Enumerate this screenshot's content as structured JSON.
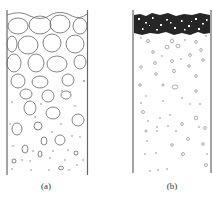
{
  "figure": {
    "panels": [
      {
        "id": "a",
        "label": "(a)",
        "description": "container with large particles settling, gradient to small particles at bottom"
      },
      {
        "id": "b",
        "label": "(b)",
        "description": "container with dense dark layer at top and sparse small particles below"
      }
    ],
    "colors": {
      "outline": "#555555",
      "dense_layer": "#222222",
      "background": "#ffffff"
    }
  }
}
